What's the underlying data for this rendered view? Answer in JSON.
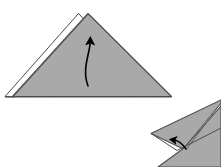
{
  "figure": {
    "kind": "origami-instruction-diagram",
    "width": 221,
    "height": 167,
    "background_color": "#FFFFFF",
    "colors": {
      "paper_front": "#A9A9A9",
      "paper_front_shade": "#9E9E9E",
      "paper_back": "#FFFFFF",
      "outline": "#4D4D4D",
      "crease": "#6E6E6E",
      "arrow": "#000000"
    },
    "shapes": [
      {
        "name": "main-triangle",
        "label": "Folded triangle (main step)",
        "description": "Large gray isoceles triangle with a thin white back-layer sliver along the upper-left edge and a second small white peak at the apex",
        "fill": "#A9A9A9",
        "points": "5,96 88,13 172,97",
        "apex": [
          88,
          13
        ],
        "left_vertex": [
          5,
          96
        ],
        "right_vertex": [
          172,
          97
        ]
      },
      {
        "name": "back-layer-sliver",
        "label": "White back layer along upper-left edge",
        "fill": "#FFFFFF",
        "points": "5,96 78,14 86,21 13,97"
      },
      {
        "name": "hidden-peak",
        "label": "Small white peak behind apex",
        "fill": "#FFFFFF",
        "points": "78,14 88,26 70,24"
      },
      {
        "name": "lower-right-figure",
        "label": "Partial next-step figure: two pointed flaps",
        "fill": "#A9A9A9",
        "flap_left": "152,133 221,101 221,118 188,150",
        "flap_right": "221,104 221,167 160,167 175,150"
      }
    ],
    "arrows": [
      {
        "name": "main-fold-arrow",
        "label": "Curved arrow indicating fold upward",
        "color": "#000000",
        "path": "M 88 86 C 82 68 90 52 90 40",
        "head_at": [
          90,
          37
        ],
        "head_direction": "up",
        "style": "curved-solid"
      },
      {
        "name": "secondary-fold-arrow",
        "label": "Short arrow indicating flap movement",
        "color": "#000000",
        "path": "M 185 147 C 180 141 176 139 172 139",
        "head_at": [
          171,
          139
        ],
        "head_direction": "up-left",
        "style": "curved-solid"
      }
    ],
    "creases": [
      {
        "name": "crease-main-left",
        "label": "Fold edge on left face",
        "from": [
          13,
          97
        ],
        "to": [
          86,
          21
        ]
      },
      {
        "name": "crease-lower-right",
        "label": "Fold edge between flaps",
        "from": [
          188,
          150
        ],
        "to": [
          221,
          103
        ]
      }
    ],
    "caption": ""
  }
}
